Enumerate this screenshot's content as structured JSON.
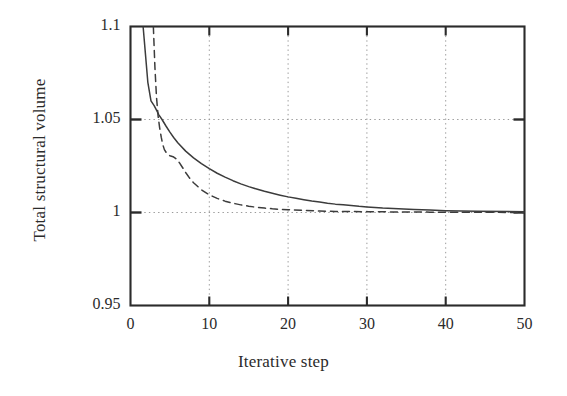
{
  "chart_data": {
    "type": "line",
    "title": "",
    "xlabel": "Iterative step",
    "ylabel": "Total structural volume",
    "xlim": [
      0,
      50
    ],
    "ylim": [
      0.95,
      1.1
    ],
    "xticks": [
      0,
      10,
      20,
      30,
      40,
      50
    ],
    "yticks": [
      0.95,
      1,
      1.05,
      1.1
    ],
    "xtick_labels": [
      "0",
      "10",
      "20",
      "30",
      "40",
      "50"
    ],
    "ytick_labels": [
      "0.95",
      "1",
      "1.05",
      "1.1"
    ],
    "grid": "dotted gridlines at every major x and y tick",
    "legend": "none",
    "series": [
      {
        "name": "solid-curve",
        "style": "solid",
        "color": "#3c3c3c",
        "x": [
          1.6,
          1.9,
          2.2,
          2.6,
          3.0,
          3.3,
          3.6,
          4.0,
          4.5,
          5.0,
          5.5,
          6.0,
          7.0,
          8.0,
          9.0,
          10.0,
          11.0,
          12.0,
          13.0,
          14.0,
          15.0,
          16.0,
          17.0,
          18.0,
          19.0,
          20.0,
          21.0,
          22.0,
          23.0,
          24.0,
          25.0,
          26.0,
          27.0,
          28.0,
          29.0,
          30.0,
          32.0,
          34.0,
          36.0,
          38.0,
          40.0,
          44.0,
          50.0
        ],
        "y": [
          1.1,
          1.085,
          1.07,
          1.06,
          1.0575,
          1.055,
          1.0525,
          1.05,
          1.0465,
          1.0432,
          1.0402,
          1.0375,
          1.033,
          1.0294,
          1.0263,
          1.0236,
          1.0211,
          1.019,
          1.0171,
          1.0154,
          1.0139,
          1.0126,
          1.0114,
          1.0103,
          1.0093,
          1.0084,
          1.0076,
          1.0069,
          1.0062,
          1.0056,
          1.005,
          1.0045,
          1.0041,
          1.0037,
          1.0033,
          1.003,
          1.0024,
          1.002,
          1.0016,
          1.0013,
          1.001,
          1.0007,
          1.0004
        ]
      },
      {
        "name": "dashed-curve",
        "style": "dashed",
        "color": "#3c3c3c",
        "x": [
          2.9,
          3.1,
          3.3,
          3.5,
          3.7,
          3.9,
          4.1,
          4.3,
          4.6,
          5.0,
          5.4,
          5.8,
          6.2,
          6.6,
          7.0,
          7.5,
          8.0,
          9.0,
          10.0,
          11.0,
          12.0,
          13.0,
          14.0,
          15.0,
          16.0,
          17.0,
          18.0,
          19.0,
          20.0,
          22.0,
          24.0,
          26.0,
          28.0,
          30.0,
          34.0,
          38.0,
          42.0,
          46.0,
          50.0
        ],
        "y": [
          1.1,
          1.078,
          1.062,
          1.052,
          1.0455,
          1.0405,
          1.0365,
          1.0338,
          1.0318,
          1.0305,
          1.03,
          1.0288,
          1.0268,
          1.0242,
          1.0215,
          1.0185,
          1.016,
          1.0122,
          1.0095,
          1.0076,
          1.0061,
          1.005,
          1.0041,
          1.0034,
          1.0028,
          1.0024,
          1.002,
          1.0017,
          1.0015,
          1.0011,
          1.0008,
          1.0006,
          1.0005,
          1.0004,
          1.0003,
          1.0002,
          1.0001,
          1.0001,
          1.0
        ]
      }
    ]
  },
  "axes": {
    "frame_color": "#2b2b2b",
    "grid_color": "#9a9a9a",
    "background": "#ffffff"
  }
}
